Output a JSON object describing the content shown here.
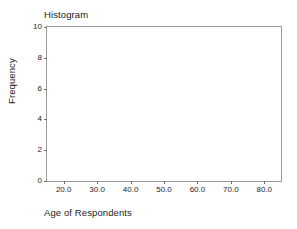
{
  "chart_data": {
    "type": "bar",
    "title": "Histogram",
    "xlabel": "Age of Respondents",
    "ylabel": "Frequency",
    "categories": [],
    "values": [],
    "series": [],
    "xlim": [
      15,
      85
    ],
    "ylim": [
      0,
      10
    ],
    "xticks": [
      20,
      30,
      40,
      50,
      60,
      70,
      80
    ],
    "xticklabels": [
      "20.0",
      "30.0",
      "40.0",
      "50.0",
      "60.0",
      "70.0",
      "80.0"
    ],
    "yticks": [
      0,
      2,
      4,
      6,
      8,
      10
    ],
    "yticklabels": [
      "0",
      "2",
      "4",
      "6",
      "8",
      "10"
    ],
    "grid": false,
    "legend": null,
    "annotations": [],
    "note": "Empty plot area - no bars rendered"
  },
  "style": {
    "frame_color": "#9a9a9a",
    "tick_color": "#6f6f6f",
    "text_color": "#1c1c1c",
    "background": "#ffffff"
  }
}
